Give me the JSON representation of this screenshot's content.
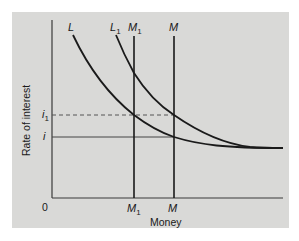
{
  "diagram": {
    "colors": {
      "background": "#ffffff",
      "panel": "#d9d9d7",
      "ink": "#1a1a1a",
      "dashed": "#555555"
    },
    "axes": {
      "y_label": "Rate of interest",
      "x_label": "Money",
      "origin_label": "0"
    },
    "curves": {
      "L": {
        "label": "L",
        "sub": ""
      },
      "L1": {
        "label": "L",
        "sub": "1"
      }
    },
    "supply_lines": {
      "M1": {
        "label": "M",
        "sub": "1"
      },
      "M": {
        "label": "M",
        "sub": ""
      }
    },
    "rate_levels": {
      "i1": {
        "label": "i",
        "sub": "1",
        "style": "dashed"
      },
      "i": {
        "label": "i",
        "sub": "",
        "style": "solid"
      }
    },
    "x_ticks": {
      "M1": {
        "label": "M",
        "sub": "1"
      },
      "M": {
        "label": "M",
        "sub": ""
      }
    }
  }
}
